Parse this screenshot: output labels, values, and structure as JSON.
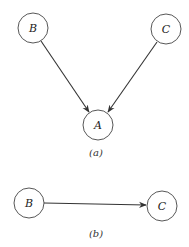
{
  "diagrams": [
    {
      "id": "a",
      "caption": "(a)",
      "nodes": [
        {
          "label": "B",
          "cx": 33,
          "cy": 28
        },
        {
          "label": "C",
          "cx": 166,
          "cy": 29
        },
        {
          "label": "A",
          "cx": 98,
          "cy": 125
        }
      ],
      "edges": [
        {
          "from": "B",
          "to": "A"
        },
        {
          "from": "C",
          "to": "A"
        }
      ]
    },
    {
      "id": "b",
      "caption": "(b)",
      "nodes": [
        {
          "label": "B",
          "cx": 29,
          "cy": 203
        },
        {
          "label": "C",
          "cx": 162,
          "cy": 206
        }
      ],
      "edges": [
        {
          "from": "B",
          "to": "C"
        }
      ]
    }
  ],
  "style": {
    "stroke": "#333333",
    "background": "#ffffff"
  }
}
